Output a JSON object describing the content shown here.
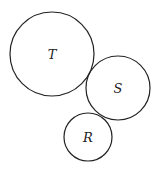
{
  "diagram": {
    "circles": [
      {
        "label": "T",
        "cx": 52,
        "cy": 54,
        "r": 42
      },
      {
        "label": "S",
        "cx": 118,
        "cy": 88,
        "r": 32
      },
      {
        "label": "R",
        "cx": 88,
        "cy": 137,
        "r": 24
      }
    ],
    "stroke_color": "#222222"
  }
}
